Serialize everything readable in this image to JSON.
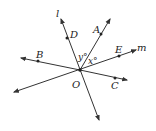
{
  "diagram": {
    "type": "geometry-lines-and-rays",
    "origin": {
      "label": "O"
    },
    "lines": [
      {
        "name": "l",
        "label": "l"
      },
      {
        "name": "m",
        "label": "m"
      }
    ],
    "rays": [
      {
        "name": "OA",
        "point_label": "A"
      },
      {
        "name": "OB",
        "point_label": "B"
      },
      {
        "name": "OC",
        "point_label": "C"
      }
    ],
    "points": {
      "D": "D",
      "A": "A",
      "E": "E",
      "B": "B",
      "C": "C",
      "O": "O"
    },
    "angles": {
      "y": "y°",
      "x": "x°"
    },
    "line_labels": {
      "l": "l",
      "m": "m"
    },
    "colors": {
      "stroke": "#333333",
      "background": "#ffffff"
    }
  }
}
